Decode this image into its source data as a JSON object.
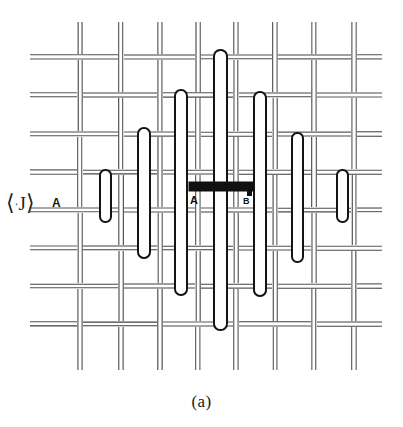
{
  "figure": {
    "caption": "(a)",
    "labels": {
      "observable": "⟨·J⟩",
      "observable_plain": "<J>",
      "left_site": "A",
      "bar_left": "A",
      "bar_right": "B"
    },
    "background_color": "#ffffff",
    "ink_color": "#1a1a1a",
    "bar_color": "#111111",
    "lattice": {
      "description": "woven double-line square lattice",
      "line_color": "#3a3a3a",
      "vertical_line_x": [
        80,
        121,
        160,
        198,
        236,
        275,
        314,
        354
      ],
      "horizontal_line_y": [
        57,
        95,
        134,
        172,
        210,
        248,
        286,
        324
      ],
      "pair_offset_px": 4,
      "segment_gap_px": 6
    },
    "rods": [
      {
        "id": "rod-1",
        "x": 100,
        "y_top": 170,
        "y_bottom": 222,
        "width": 11
      },
      {
        "id": "rod-2",
        "x": 138,
        "y_top": 128,
        "y_bottom": 258,
        "width": 12
      },
      {
        "id": "rod-3",
        "x": 175,
        "y_top": 90,
        "y_bottom": 295,
        "width": 12
      },
      {
        "id": "rod-4",
        "x": 214,
        "y_top": 50,
        "y_bottom": 330,
        "width": 13
      },
      {
        "id": "rod-5",
        "x": 254,
        "y_top": 92,
        "y_bottom": 296,
        "width": 12
      },
      {
        "id": "rod-6",
        "x": 292,
        "y_top": 133,
        "y_bottom": 262,
        "width": 11
      },
      {
        "id": "rod-7",
        "x": 337,
        "y_top": 170,
        "y_bottom": 222,
        "width": 11
      }
    ],
    "bar": {
      "id": "transport-bar",
      "x_left": 189,
      "x_right": 253,
      "y_top": 182,
      "height": 9
    }
  }
}
